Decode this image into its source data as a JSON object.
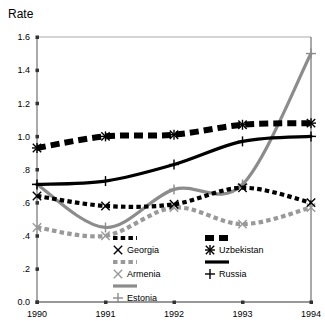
{
  "chart_data": {
    "type": "line",
    "title": "Rate",
    "xlabel": "",
    "ylabel": "Rate",
    "x": [
      1990,
      1991,
      1992,
      1993,
      1994
    ],
    "xtick_labels": [
      "1990",
      "1991",
      "1992",
      "1993",
      "1994"
    ],
    "ytick_labels": [
      "0.0",
      ".2",
      ".4",
      ".6",
      ".8",
      "1.0",
      "1.2",
      "1.4",
      "1.6"
    ],
    "ytick_values": [
      0.0,
      0.2,
      0.4,
      0.6,
      0.8,
      1.0,
      1.2,
      1.4,
      1.6
    ],
    "xlim": [
      1990,
      1994
    ],
    "ylim": [
      0.0,
      1.6
    ],
    "grid": false,
    "legend_position": "inside-bottom-center",
    "series": [
      {
        "name": "Georgia",
        "values": [
          0.64,
          0.58,
          0.59,
          0.69,
          0.6
        ],
        "marker": "x",
        "color": "#000000",
        "line_style": "dotted-thick",
        "legend_swatch": "dotted-black"
      },
      {
        "name": "Uzbekistan",
        "values": [
          0.93,
          1.0,
          1.01,
          1.07,
          1.08
        ],
        "marker": "asterisk",
        "color": "#000000",
        "line_style": "dashed-thick",
        "legend_swatch": "dashed-black"
      },
      {
        "name": "Armenia",
        "values": [
          0.45,
          0.4,
          0.57,
          0.47,
          0.57
        ],
        "marker": "x",
        "color": "#999999",
        "line_style": "dotted-thick",
        "legend_swatch": "dotted-gray"
      },
      {
        "name": "Russia",
        "values": [
          0.71,
          0.73,
          0.83,
          0.97,
          1.0
        ],
        "marker": "plus",
        "color": "#000000",
        "line_style": "solid-thick",
        "legend_swatch": "solid-black"
      },
      {
        "name": "Estonia",
        "values": [
          0.71,
          0.45,
          0.68,
          0.71,
          1.5
        ],
        "marker": "plus",
        "color": "#8c8c8c",
        "line_style": "solid-thick",
        "legend_swatch": "solid-gray"
      }
    ],
    "annotations": []
  },
  "legend": {
    "entries": [
      {
        "label": "Georgia"
      },
      {
        "label": "Uzbekistan"
      },
      {
        "label": "Armenia"
      },
      {
        "label": "Russia"
      },
      {
        "label": "Estonia"
      }
    ]
  },
  "colors": {
    "black": "#000000",
    "gray": "#8c8c8c",
    "light_gray": "#a6a6a6",
    "axis": "#333333",
    "background": "#ffffff"
  }
}
